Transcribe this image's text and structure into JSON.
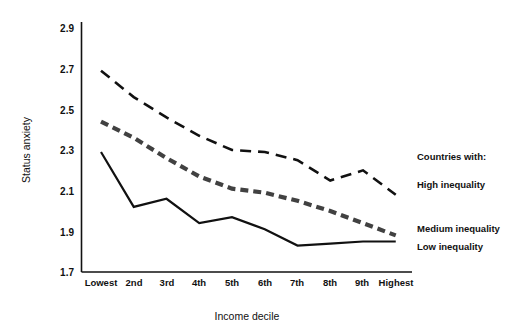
{
  "chart_data": {
    "type": "line",
    "title": "",
    "xlabel": "Income decile",
    "ylabel": "Status anxiety",
    "categories": [
      "Lowest",
      "2nd",
      "3rd",
      "4th",
      "5th",
      "6th",
      "7th",
      "8th",
      "9th",
      "Highest"
    ],
    "ylim": [
      1.7,
      2.9
    ],
    "yticks": [
      "1.7",
      "1.9",
      "2.1",
      "2.3",
      "2.5",
      "2.7",
      "2.9"
    ],
    "ytick_values": [
      1.7,
      1.9,
      2.1,
      2.3,
      2.5,
      2.7,
      2.9
    ],
    "grid": false,
    "legend_position": "right-inline",
    "series": [
      {
        "name": "High inequality",
        "style": "long-dashed",
        "color": "#111111",
        "values": [
          2.69,
          2.56,
          2.46,
          2.37,
          2.3,
          2.29,
          2.25,
          2.15,
          2.2,
          2.08
        ]
      },
      {
        "name": "Medium inequality",
        "style": "thick-short-dashed",
        "color": "#414141",
        "values": [
          2.44,
          2.36,
          2.26,
          2.17,
          2.11,
          2.09,
          2.05,
          2.0,
          1.94,
          1.88
        ]
      },
      {
        "name": "Low inequality",
        "style": "solid",
        "color": "#111111",
        "values": [
          2.29,
          2.02,
          2.06,
          1.94,
          1.97,
          1.91,
          1.83,
          1.84,
          1.85,
          1.85
        ]
      }
    ]
  },
  "axes": {
    "y_title": "Status anxiety",
    "x_title": "Income decile",
    "y_tick_labels": [
      "2.9",
      "2.7",
      "2.5",
      "2.3",
      "2.1",
      "1.9",
      "1.7"
    ],
    "x_tick_labels": [
      "Lowest",
      "2nd",
      "3rd",
      "4th",
      "5th",
      "6th",
      "7th",
      "8th",
      "9th",
      "Highest"
    ]
  },
  "legend": {
    "header": "Countries with:",
    "entries": [
      {
        "label": "High inequality"
      },
      {
        "label": "Medium inequality"
      },
      {
        "label": "Low inequality"
      }
    ]
  },
  "colors": {
    "background": "#ffffff",
    "axis": "#111111",
    "high": "#111111",
    "medium": "#414141",
    "low": "#111111",
    "text": "#111111"
  }
}
